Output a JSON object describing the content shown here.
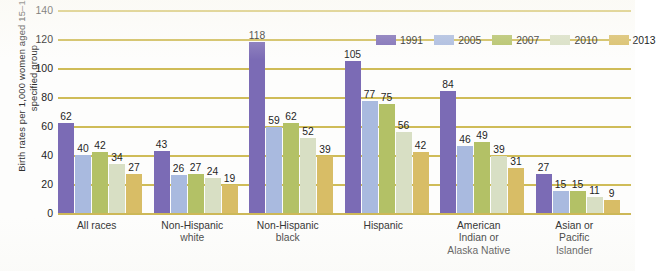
{
  "chart_data": {
    "type": "bar",
    "title": "",
    "subtitle": "",
    "xlabel": "",
    "ylabel": "Birth rates per 1,000 women aged 15–19 in specified group",
    "ylim": [
      0,
      140
    ],
    "ytick_step": 20,
    "yticks": [
      0,
      20,
      40,
      60,
      80,
      100,
      120,
      140
    ],
    "ytick_labels": [
      "0",
      "20",
      "40",
      "60",
      "80",
      "100",
      "120",
      "140"
    ],
    "grid": true,
    "grid_color": "#cbb64a",
    "legend_position": "top-right",
    "categories": [
      "All races",
      "Non-Hispanic white",
      "Non-Hispanic black",
      "Hispanic",
      "American Indian or Alaska Native",
      "Asian or Pacific Islander"
    ],
    "category_lines": [
      [
        "All races"
      ],
      [
        "Non-Hispanic",
        "white"
      ],
      [
        "Non-Hispanic",
        "black"
      ],
      [
        "Hispanic"
      ],
      [
        "American",
        "Indian or",
        "Alaska Native"
      ],
      [
        "Asian or",
        "Pacific",
        "Islander"
      ]
    ],
    "series": [
      {
        "name": "1991",
        "color": "#7b6bb5",
        "values": [
          62,
          43,
          118,
          105,
          84,
          27
        ]
      },
      {
        "name": "2005",
        "color": "#a9badf",
        "values": [
          40,
          26,
          59,
          77,
          46,
          15
        ]
      },
      {
        "name": "2007",
        "color": "#b3c166",
        "values": [
          42,
          27,
          62,
          75,
          49,
          15
        ]
      },
      {
        "name": "2010",
        "color": "#d8dfc4",
        "values": [
          34,
          24,
          52,
          56,
          39,
          11
        ]
      },
      {
        "name": "2013",
        "color": "#d8bd66",
        "values": [
          27,
          19,
          39,
          42,
          31,
          9
        ]
      }
    ]
  },
  "legend": {
    "items": [
      {
        "label": "1991",
        "color": "#7b6bb5"
      },
      {
        "label": "2005",
        "color": "#a9badf"
      },
      {
        "label": "2007",
        "color": "#b3c166"
      },
      {
        "label": "2010",
        "color": "#d8dfc4"
      },
      {
        "label": "2013",
        "color": "#d8bd66"
      }
    ]
  }
}
